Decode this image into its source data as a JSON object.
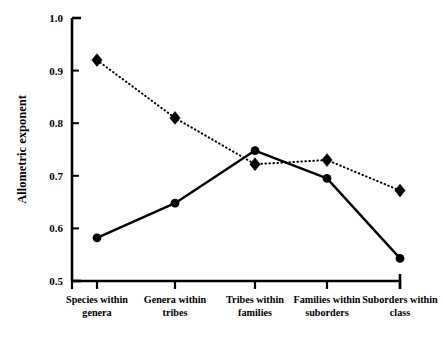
{
  "chart_data": {
    "type": "line",
    "title": "",
    "xlabel": "",
    "ylabel": "Allometric exponent",
    "ylim": [
      0.5,
      1.0
    ],
    "yticks": [
      "0.5",
      "0.6",
      "0.7",
      "0.8",
      "0.9",
      "1.0"
    ],
    "ytick_values": [
      0.5,
      0.6,
      0.7,
      0.8,
      0.9,
      1.0
    ],
    "grid": false,
    "legend": "none",
    "categories": [
      "Species within genera",
      "Genera within tribes",
      "Tribes within families",
      "Families within suborders",
      "Suborders within class"
    ],
    "category_lines": [
      [
        "Species within",
        "genera"
      ],
      [
        "Genera within",
        "tribes"
      ],
      [
        "Tribes within",
        "families"
      ],
      [
        "Families within",
        "suborders"
      ],
      [
        "Suborders within",
        "class"
      ]
    ],
    "series": [
      {
        "name": "dotted-diamond-series",
        "marker": "diamond",
        "linestyle": "dotted",
        "color": "#000000",
        "values": [
          0.92,
          0.81,
          0.722,
          0.73,
          0.672
        ]
      },
      {
        "name": "solid-circle-series",
        "marker": "circle",
        "linestyle": "solid",
        "color": "#000000",
        "values": [
          0.582,
          0.648,
          0.748,
          0.695,
          0.543
        ]
      }
    ]
  },
  "axes": {
    "y_axis_title": "Allometric exponent",
    "y_min_label": "0.5",
    "y_max_label": "1.0"
  },
  "colors": {
    "foreground": "#000000",
    "background": "#ffffff"
  }
}
